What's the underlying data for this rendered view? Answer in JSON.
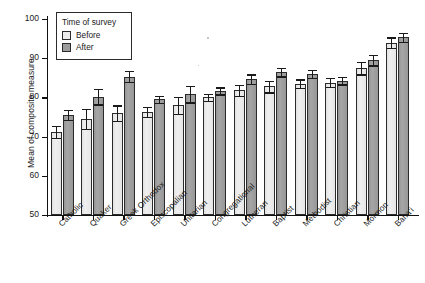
{
  "chart_data": {
    "type": "bar",
    "title": "",
    "xlabel": "",
    "ylabel": "Mean of composite measure",
    "ylim": [
      50,
      100
    ],
    "yticks": [
      50,
      60,
      70,
      80,
      90,
      100
    ],
    "grid": false,
    "legend_position": "upper-left",
    "legend_title": "Time of survey",
    "categories": [
      "Catholic",
      "Quaker",
      "Greek Orthodox",
      "Episcopalian",
      "Unitarian",
      "Congregational",
      "Lutheran",
      "Baptist",
      "Methodist",
      "Christian",
      "Mormon",
      "Baha'i"
    ],
    "series": [
      {
        "name": "Before",
        "color": "#ececec",
        "values": [
          71.2,
          74.5,
          76.0,
          76.3,
          78.0,
          80.0,
          81.8,
          82.8,
          83.5,
          83.8,
          87.5,
          94.0
        ],
        "errors": [
          1.6,
          2.6,
          2.0,
          1.3,
          2.2,
          0.9,
          1.4,
          1.5,
          1.1,
          1.1,
          1.6,
          1.3
        ]
      },
      {
        "name": "After",
        "color": "#9d9d9d",
        "values": [
          75.5,
          80.2,
          85.3,
          79.5,
          80.8,
          81.7,
          84.7,
          86.5,
          86.0,
          84.3,
          89.5,
          95.3
        ],
        "errors": [
          1.3,
          2.0,
          1.4,
          0.9,
          2.1,
          0.9,
          1.2,
          1.1,
          1.0,
          1.0,
          1.3,
          1.2
        ]
      }
    ]
  },
  "legend": {
    "title": "Time of survey",
    "entries": [
      {
        "label": "Before",
        "swatch": "before"
      },
      {
        "label": "After",
        "swatch": "after"
      }
    ]
  },
  "axes": {
    "y_title": "Mean of composite measure"
  }
}
